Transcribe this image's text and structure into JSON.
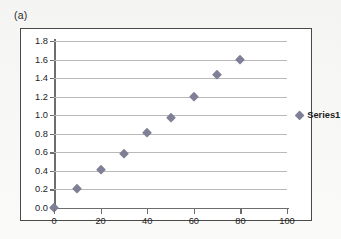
{
  "panel": {
    "label": "(a)"
  },
  "colors": {
    "marker": "#7f7f96",
    "gridline": "#b9b9b9",
    "axis": "#6d6d6d",
    "frame_border": "#4a4a4a",
    "plot_background": "#ffffff",
    "page_background": "#f4f4f2",
    "text": "#1d1d1d"
  },
  "chart_data": {
    "type": "scatter",
    "title": "",
    "subtitle": "",
    "xlabel": "",
    "ylabel": "",
    "xlim": [
      0,
      100
    ],
    "ylim": [
      0.0,
      1.8
    ],
    "grid": true,
    "grid_axis": "y",
    "legend_position": "right",
    "x_ticks": [
      0,
      20,
      40,
      60,
      80,
      100
    ],
    "x_tick_labels": [
      "0",
      "20",
      "40",
      "60",
      "80",
      "100"
    ],
    "y_ticks": [
      0.0,
      0.2,
      0.4,
      0.6,
      0.8,
      1.0,
      1.2,
      1.4,
      1.6,
      1.8
    ],
    "y_tick_labels": [
      "0.0",
      "0.2",
      "0.4",
      "0.6",
      "0.8",
      "1.0",
      "1.2",
      "1.4",
      "1.6",
      "1.8"
    ],
    "marker_shape": "diamond",
    "series": [
      {
        "name": "Series1",
        "x": [
          0,
          10,
          20,
          30,
          40,
          50,
          60,
          70,
          80
        ],
        "y": [
          0.0,
          0.21,
          0.41,
          0.585,
          0.81,
          0.975,
          1.2,
          1.435,
          1.6
        ],
        "points": [
          {
            "x": 0,
            "y": 0.0
          },
          {
            "x": 10,
            "y": 0.21
          },
          {
            "x": 20,
            "y": 0.41
          },
          {
            "x": 30,
            "y": 0.585
          },
          {
            "x": 40,
            "y": 0.81
          },
          {
            "x": 50,
            "y": 0.975
          },
          {
            "x": 60,
            "y": 1.2
          },
          {
            "x": 70,
            "y": 1.435
          },
          {
            "x": 80,
            "y": 1.6
          }
        ]
      }
    ]
  },
  "legend": {
    "entries": [
      {
        "label": "Series1",
        "value_y": 1.0
      }
    ]
  }
}
